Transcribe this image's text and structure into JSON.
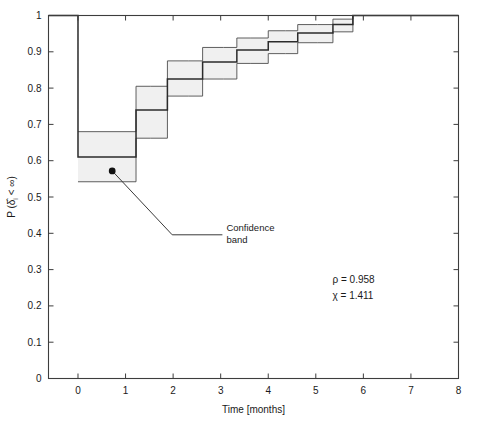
{
  "chart_data": {
    "type": "line",
    "title": "",
    "xlabel": "Time [months]",
    "ylabel": "P (δ̂ᵢ < ∞)",
    "xlim": [
      -0.62,
      8.0
    ],
    "ylim": [
      0.0,
      1.0
    ],
    "grid": false,
    "legend": null,
    "xticks": [
      0,
      1,
      2,
      3,
      4,
      5,
      6,
      7,
      8
    ],
    "xtick_labels": [
      "0",
      "1",
      "2",
      "3",
      "4",
      "5",
      "6",
      "7",
      "8"
    ],
    "yticks": [
      0,
      0.1,
      0.2,
      0.3,
      0.4,
      0.5,
      0.6,
      0.7,
      0.8,
      0.9,
      1
    ],
    "ytick_labels": [
      "0",
      "0.1",
      "0.2",
      "0.3",
      "0.4",
      "0.5",
      "0.6",
      "0.7",
      "0.8",
      "0.9",
      "1"
    ],
    "series": [
      {
        "name": "survival-estimate",
        "style": "step-post",
        "color": "#2b2b2b",
        "x": [
          -0.62,
          0.0,
          1.22,
          1.52,
          1.88,
          2.32,
          2.62,
          3.06,
          3.34,
          3.62,
          4.0,
          4.36,
          4.62,
          5.04,
          5.36,
          5.78,
          8.0
        ],
        "y": [
          1.0,
          0.61,
          0.74,
          0.74,
          0.825,
          0.825,
          0.872,
          0.872,
          0.905,
          0.905,
          0.928,
          0.928,
          0.952,
          0.952,
          0.975,
          1.0,
          1.0
        ]
      },
      {
        "name": "confidence-band-upper",
        "style": "step-post",
        "color": "#3a3a3a",
        "x": [
          0.0,
          1.22,
          1.52,
          1.88,
          2.32,
          2.62,
          3.06,
          3.34,
          3.62,
          4.0,
          4.36,
          4.62,
          5.04,
          5.36,
          5.78,
          8.0
        ],
        "y": [
          0.68,
          0.805,
          0.805,
          0.875,
          0.875,
          0.912,
          0.912,
          0.938,
          0.938,
          0.958,
          0.958,
          0.975,
          0.975,
          0.99,
          1.0,
          1.0
        ]
      },
      {
        "name": "confidence-band-lower",
        "style": "step-post",
        "color": "#3a3a3a",
        "x": [
          0.0,
          1.22,
          1.52,
          1.88,
          2.32,
          2.62,
          3.06,
          3.34,
          3.62,
          4.0,
          4.36,
          4.62,
          5.04,
          5.36,
          5.78,
          8.0
        ],
        "y": [
          0.542,
          0.662,
          0.662,
          0.778,
          0.778,
          0.825,
          0.825,
          0.868,
          0.868,
          0.895,
          0.895,
          0.925,
          0.925,
          0.955,
          1.0,
          1.0
        ]
      }
    ],
    "band": {
      "name": "confidence-band",
      "fill": "#f0f0f0",
      "stroke": "#4d4d4d"
    },
    "annotations": [
      {
        "name": "confidence-band-callout",
        "text_line1": "Confidence",
        "text_line2": "band",
        "point": [
          0.72,
          0.572
        ],
        "elbow": [
          1.98,
          0.396
        ],
        "text_anchor": [
          3.12,
          0.396
        ]
      },
      {
        "name": "stat-rho",
        "text": "ρ = 0.958",
        "position": [
          5.35,
          0.262
        ]
      },
      {
        "name": "stat-chi",
        "text": "χ = 1.411",
        "position": [
          5.35,
          0.218
        ]
      }
    ]
  },
  "stats": {
    "rho_label": "ρ = 0.958",
    "chi_label": "χ = 1.411",
    "rho_value": 0.958,
    "chi_value": 1.411
  },
  "annotation": {
    "line1": "Confidence",
    "line2": "band"
  },
  "axes": {
    "x_title": "Time [months]",
    "y_title_main": "P (",
    "y_title_sym": "δ",
    "y_title_sub": "i",
    "y_title_rest": " < ∞)",
    "y_title_full": "P (δ̂i < ∞)"
  },
  "colors": {
    "band_fill": "#f0f0f0",
    "curve": "#2b2b2b",
    "band_edge": "#4d4d4d",
    "frame": "#3d3d3d",
    "text": "#1a1a1a",
    "background": "#ffffff"
  }
}
